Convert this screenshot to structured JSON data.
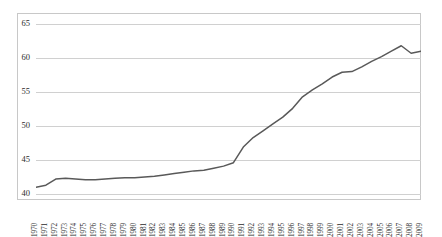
{
  "chart_data": {
    "type": "line",
    "title": "",
    "subtitle": "",
    "xlabel": "",
    "ylabel": "",
    "xlim": [
      1970,
      2009
    ],
    "ylim": [
      40,
      65
    ],
    "yticks": [
      40,
      45,
      50,
      55,
      60,
      65
    ],
    "grid": true,
    "legend": false,
    "legend_position": "none",
    "line_color": "#595959",
    "grid_color": "#d0d0d0",
    "frame_color": "#c8c8c8",
    "markers": "none",
    "categories": [
      "1970",
      "1971",
      "1972",
      "1973",
      "1974",
      "1975",
      "1976",
      "1977",
      "1978",
      "1979",
      "1980",
      "1981",
      "1982",
      "1983",
      "1984",
      "1985",
      "1986",
      "1987",
      "1988",
      "1989",
      "1990",
      "1991",
      "1992",
      "1993",
      "1994",
      "1995",
      "1996",
      "1997",
      "1998",
      "1999",
      "2000",
      "2001",
      "2002",
      "2003",
      "2004",
      "2005",
      "2006",
      "2007",
      "2008",
      "2009"
    ],
    "x": [
      1970,
      1971,
      1972,
      1973,
      1974,
      1975,
      1976,
      1977,
      1978,
      1979,
      1980,
      1981,
      1982,
      1983,
      1984,
      1985,
      1986,
      1987,
      1988,
      1989,
      1990,
      1991,
      1992,
      1993,
      1994,
      1995,
      1996,
      1997,
      1998,
      1999,
      2000,
      2001,
      2002,
      2003,
      2004,
      2005,
      2006,
      2007,
      2008,
      2009
    ],
    "values": [
      41.0,
      41.3,
      42.2,
      42.3,
      42.2,
      42.1,
      42.1,
      42.2,
      42.3,
      42.4,
      42.4,
      42.5,
      42.6,
      42.8,
      43.0,
      43.2,
      43.4,
      43.5,
      43.8,
      44.1,
      44.6,
      46.9,
      48.3,
      49.3,
      50.3,
      51.3,
      52.6,
      54.3,
      55.3,
      56.2,
      57.2,
      57.9,
      58.0,
      58.7,
      59.5,
      60.2,
      61.0,
      61.8,
      60.7,
      61.0
    ],
    "series": [
      {
        "name": "series-1",
        "color": "#595959",
        "values": [
          41.0,
          41.3,
          42.2,
          42.3,
          42.2,
          42.1,
          42.1,
          42.2,
          42.3,
          42.4,
          42.4,
          42.5,
          42.6,
          42.8,
          43.0,
          43.2,
          43.4,
          43.5,
          43.8,
          44.1,
          44.6,
          46.9,
          48.3,
          49.3,
          50.3,
          51.3,
          52.6,
          54.3,
          55.3,
          56.2,
          57.2,
          57.9,
          58.0,
          58.7,
          59.5,
          60.2,
          61.0,
          61.8,
          60.7,
          61.0
        ]
      }
    ]
  }
}
